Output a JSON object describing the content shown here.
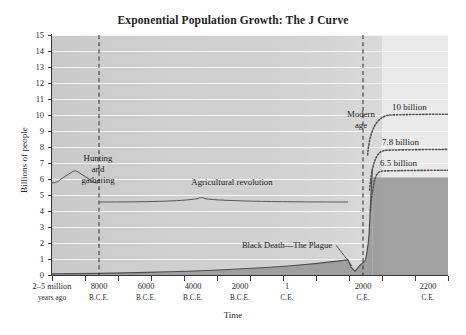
{
  "chart_data": {
    "type": "area",
    "title": "Exponential Population Growth: The J Curve",
    "xlabel": "Time",
    "ylabel": "Billions of people",
    "ylim": [
      0,
      15
    ],
    "ytick_labels": [
      "0",
      "1",
      "2",
      "3",
      "4",
      "5",
      "6",
      "7",
      "8",
      "9",
      "10",
      "11",
      "12",
      "13",
      "14",
      "15"
    ],
    "grid": true,
    "legend_position": "none",
    "xtick_labels": [
      {
        "main": "2–5 million",
        "sub": "years ago"
      },
      {
        "main": "8000",
        "sub": "B.C.E."
      },
      {
        "main": "6000",
        "sub": "B.C.E."
      },
      {
        "main": "4000",
        "sub": "B.C.E."
      },
      {
        "main": "2000",
        "sub": "B.C.E."
      },
      {
        "main": "1",
        "sub": "C.E."
      },
      {
        "main": "2000",
        "sub": "C.E."
      },
      {
        "main": "2200",
        "sub": "C.E."
      }
    ],
    "series": [
      {
        "name": "World population (historical)",
        "style": "solid-filled",
        "x": [
          "2-5 million years ago",
          "8000 B.C.E.",
          "6000 B.C.E.",
          "4000 B.C.E.",
          "2000 B.C.E.",
          "1 C.E.",
          "1000 C.E.",
          "1350 C.E.",
          "1400 C.E.",
          "1700 C.E.",
          "1800 C.E.",
          "1900 C.E.",
          "1950 C.E.",
          "2000 C.E."
        ],
        "values": [
          0.0,
          0.005,
          0.01,
          0.03,
          0.1,
          0.2,
          0.3,
          0.43,
          0.35,
          0.6,
          1.0,
          1.65,
          2.5,
          6.1
        ]
      },
      {
        "name": "Projection — high",
        "style": "dotted",
        "plateau_value": 10,
        "label": "10 billion"
      },
      {
        "name": "Projection — medium",
        "style": "dotted",
        "plateau_value": 7.8,
        "label": "7.8 billion"
      },
      {
        "name": "Projection — low",
        "style": "dotted",
        "plateau_value": 6.5,
        "label": "6.5 billion"
      }
    ],
    "annotations": [
      {
        "name": "hunting-and-gathering",
        "text": "Hunting and gathering",
        "lines": [
          "Hunting",
          "and",
          "gathering"
        ]
      },
      {
        "name": "agricultural-revolution",
        "text": "Agricultural revolution"
      },
      {
        "name": "modern-age",
        "text": "Modern age",
        "lines": [
          "Modern",
          "age"
        ]
      },
      {
        "name": "black-death",
        "text": "Black Death—The Plague"
      },
      {
        "name": "projection-10-billion",
        "text": "10 billion"
      },
      {
        "name": "projection-78-billion",
        "text": "7.8 billion"
      },
      {
        "name": "projection-65-billion",
        "text": "6.5 billion"
      }
    ]
  },
  "title": "Exponential Population Growth: The J Curve",
  "axes": {
    "y_label": "Billions of people",
    "x_label": "Time"
  },
  "annotations": {
    "hunting_line1": "Hunting",
    "hunting_line2": "and",
    "hunting_line3": "gathering",
    "agricultural": "Agricultural revolution",
    "modern_line1": "Modern",
    "modern_line2": "age",
    "black_death": "Black Death—The Plague",
    "proj_high": "10 billion",
    "proj_mid": "7.8 billion",
    "proj_low": "6.5 billion"
  },
  "colors": {
    "plot_background": "#cfcfcf",
    "band_light": "#eaeaea",
    "curve_fill": "#9a9a9a",
    "curve_stroke": "#4a4a4a",
    "gridline": "#f4f4f4",
    "axis": "#3a3a3a",
    "text": "#1d1d1d"
  }
}
